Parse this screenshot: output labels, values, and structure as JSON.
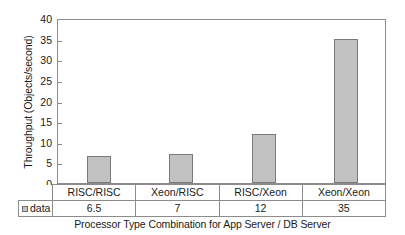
{
  "chart_data": {
    "type": "bar",
    "title": "",
    "categories": [
      "RISC/RISC",
      "Xeon/RISC",
      "RISC/Xeon",
      "Xeon/Xeon"
    ],
    "values": [
      6.5,
      7,
      12,
      35
    ],
    "series": [
      {
        "name": "data",
        "values": [
          6.5,
          7,
          12,
          35
        ]
      }
    ],
    "xlabel": "Processor Type Combination for App Server / DB Server",
    "ylabel": "Throughput (Objects/second)",
    "ylim": [
      0,
      40
    ],
    "ytick_step": 5,
    "yticks": [
      0,
      5,
      10,
      15,
      20,
      25,
      30,
      35,
      40
    ],
    "ytick_labels": [
      "0",
      "5",
      "10",
      "15",
      "20",
      "25",
      "30",
      "35",
      "40"
    ],
    "grid": false,
    "legend": [
      "data"
    ],
    "legend_position": "bottom-left-table",
    "value_labels": [
      "6.5",
      "7",
      "12",
      "35"
    ],
    "bar_color": "#c2c2c2",
    "bar_border_color": "#7a7a7a",
    "axis_color": "#8c8c8c"
  },
  "table": {
    "legend_label": "data",
    "category_row": [
      "RISC/RISC",
      "Xeon/RISC",
      "RISC/Xeon",
      "Xeon/Xeon"
    ],
    "value_row": [
      "6.5",
      "7",
      "12",
      "35"
    ]
  }
}
